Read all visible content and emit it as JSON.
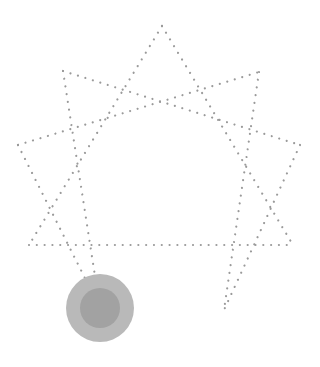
{
  "figure": {
    "type": "enneagram-star",
    "width": 320,
    "height": 367,
    "background": "#ffffff",
    "dot_color": "#9a9a9a",
    "dot_size": 2.2,
    "dot_spacing": 7.8,
    "points": {
      "top": [
        162,
        26
      ],
      "upper_left": [
        63,
        71
      ],
      "upper_right": [
        259,
        72
      ],
      "left": [
        18,
        145
      ],
      "right": [
        300,
        145
      ],
      "bottom_left": [
        29,
        245
      ],
      "bottom_right": [
        293,
        245
      ],
      "low_left": [
        100,
        308
      ],
      "low_right": [
        224,
        310
      ]
    },
    "lines": [
      {
        "name": "top-to-bottom-left",
        "from": "top",
        "to": "bottom_left"
      },
      {
        "name": "top-to-bottom-right",
        "from": "top",
        "to": "bottom_right"
      },
      {
        "name": "base-horizontal",
        "from": "bottom_left",
        "to": "bottom_right"
      },
      {
        "name": "left-to-upper-right",
        "from": "left",
        "to": "upper_right"
      },
      {
        "name": "upper-left-to-right",
        "from": "upper_left",
        "to": "right"
      },
      {
        "name": "left-to-low-left",
        "from": "left",
        "to": "low_left"
      },
      {
        "name": "upper-left-to-low-left",
        "from": "upper_left",
        "to": "low_left"
      },
      {
        "name": "right-to-low-right",
        "from": "right",
        "to": "low_right"
      },
      {
        "name": "upper-right-to-low-right",
        "from": "upper_right",
        "to": "low_right"
      }
    ],
    "marker": {
      "center": [
        100,
        308
      ],
      "outer_radius": 34,
      "inner_radius": 20,
      "outer_color": "#b9b9b9",
      "inner_color": "#a2a2a2"
    }
  }
}
